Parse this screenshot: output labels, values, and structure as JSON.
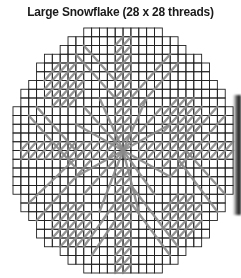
{
  "title": "Large Snowflake (28 x 28 threads)",
  "grid": {
    "cols": 28,
    "rows": 28,
    "origin_x": 13,
    "origin_y": 28,
    "cell_w": 7.86,
    "cell_h": 8.75,
    "radius_cells": 14.3,
    "line_color": "#222222",
    "stitch_color": "#8a8a8a"
  },
  "stitches": {
    "hatch_strips": [
      {
        "name": "vertical-arm-top",
        "c0": 13,
        "r0": 1,
        "c1": 14,
        "r1": 12
      },
      {
        "name": "vertical-arm-bottom",
        "c0": 13,
        "r0": 16,
        "c1": 14,
        "r1": 27
      },
      {
        "name": "horizontal-arm-left",
        "c0": 1,
        "r0": 13,
        "c1": 12,
        "r1": 14
      },
      {
        "name": "horizontal-arm-right",
        "c0": 16,
        "r0": 13,
        "c1": 27,
        "r1": 14
      }
    ],
    "blocks": [
      {
        "name": "block-nw",
        "c0": 4,
        "r0": 4,
        "c1": 8,
        "r1": 8
      },
      {
        "name": "block-ne",
        "c0": 19,
        "r0": 8,
        "c1": 23,
        "r1": 12
      },
      {
        "name": "block-sw",
        "c0": 5,
        "r0": 20,
        "c1": 9,
        "r1": 24
      },
      {
        "name": "block-se",
        "c0": 19,
        "r0": 19,
        "c1": 23,
        "r1": 23
      }
    ],
    "double_lines": [
      {
        "x1": 8,
        "y1": 3,
        "x2": 13,
        "y2": 8
      },
      {
        "x1": 9,
        "y1": 2,
        "x2": 13,
        "y2": 6
      },
      {
        "x1": 2,
        "y1": 10,
        "x2": 8,
        "y2": 16
      },
      {
        "x1": 3,
        "y1": 9,
        "x2": 8,
        "y2": 14
      },
      {
        "x1": 15,
        "y1": 8,
        "x2": 20,
        "y2": 3
      },
      {
        "x1": 16,
        "y1": 9,
        "x2": 21,
        "y2": 4
      },
      {
        "x1": 19,
        "y1": 16,
        "x2": 26,
        "y2": 9
      },
      {
        "x1": 20,
        "y1": 17,
        "x2": 27,
        "y2": 10
      },
      {
        "x1": 3,
        "y1": 22,
        "x2": 10,
        "y2": 15
      },
      {
        "x1": 2,
        "y1": 20,
        "x2": 9,
        "y2": 14
      },
      {
        "x1": 9,
        "y1": 25,
        "x2": 13,
        "y2": 20
      },
      {
        "x1": 10,
        "y1": 26,
        "x2": 13,
        "y2": 22
      },
      {
        "x1": 15,
        "y1": 20,
        "x2": 20,
        "y2": 26
      },
      {
        "x1": 15,
        "y1": 18,
        "x2": 21,
        "y2": 25
      },
      {
        "x1": 21,
        "y1": 15,
        "x2": 26,
        "y2": 21
      },
      {
        "x1": 22,
        "y1": 14,
        "x2": 27,
        "y2": 19
      }
    ],
    "rays": [
      {
        "x2": 9,
        "y2": 9
      },
      {
        "x2": 8,
        "y2": 11
      },
      {
        "x2": 19,
        "y2": 9
      },
      {
        "x2": 20,
        "y2": 11
      },
      {
        "x2": 9,
        "y2": 19
      },
      {
        "x2": 8,
        "y2": 17
      },
      {
        "x2": 18,
        "y2": 19
      },
      {
        "x2": 20,
        "y2": 17
      },
      {
        "x2": 11,
        "y2": 8
      },
      {
        "x2": 17,
        "y2": 8
      },
      {
        "x2": 11,
        "y2": 21
      },
      {
        "x2": 16,
        "y2": 21
      }
    ]
  }
}
